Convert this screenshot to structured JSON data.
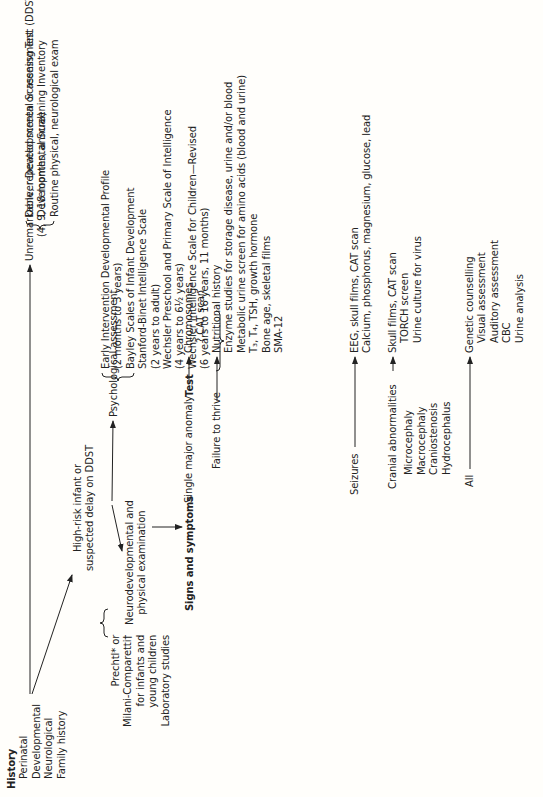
{
  "history": {
    "heading": "History",
    "items": [
      "Perinatal",
      "Developmental",
      "Neurological",
      "Family history"
    ]
  },
  "unremarkable": {
    "line1": "Unremarkable, repeated screen or assessment",
    "line2": "(4, 9, 18 months, annual)"
  },
  "screening_tests": [
    "Denver Developmental Screening Test (DDST)",
    "Developmental Screening Inventory",
    "Routine physical, neurological exam"
  ],
  "high_risk": {
    "line1": "High-risk infant or",
    "line2": "suspected delay on DDST"
  },
  "psych": {
    "label": "Psychological assessment",
    "items": [
      "Early Intervention Developmental Profile",
      "(2 months to 3 years)",
      "Bayley Scales of Infant Development",
      "Stanford-Binet Intelligence Scale",
      "(2 years to adult)",
      "Wechsler Preschool and Primary Scale of Intelligence",
      "(4 years to 6½ years)",
      "Wechsler Intelligence Scale for Children—Revised",
      "(6 years to 16 years, 11 months)"
    ]
  },
  "neuro_exam": {
    "line1": "Neurodevelopmental and",
    "line2": "physical examination"
  },
  "exam_methods": [
    "Prechtl* or",
    "Milani-Comparetti†",
    "for infants and",
    "young children",
    "Laboratory studies"
  ],
  "signs_heading": "Signs and symptoms",
  "test_heading": "Test",
  "rows": [
    {
      "sign": "Single major anomaly",
      "sub": [],
      "tests": [
        "Chromosomes",
        "? CAT scan"
      ],
      "indent": [
        false,
        true
      ]
    },
    {
      "sign": "Failure to thrive",
      "sub": [],
      "tests": [
        "Nutritional history",
        "Enzyme studies for storage disease, urine and/or blood",
        "Metabolic urine screen for amino acids (blood and urine)",
        "T₃, T₄, TSH, growth hormone",
        "Bone age, skeletal films",
        "SMA-12"
      ]
    },
    {
      "sign": "Seizures",
      "sub": [],
      "tests": [
        "EEG, skull films, CAT scan",
        "Calcium, phosphorus, magnesium, glucose, lead"
      ]
    },
    {
      "sign": "Cranial abnormalities",
      "sub": [
        "Microcephaly",
        "Macrocephaly",
        "Craniostenosis",
        "Hydrocephalus"
      ],
      "tests": [
        "Skull films, CAT scan",
        "TORCH screen",
        "Urine culture for virus"
      ]
    },
    {
      "sign": "All",
      "sub": [],
      "tests": [
        "Genetic counselling",
        "Visual assessment",
        "Auditory assessment",
        "CBC",
        "Urine analysis"
      ]
    }
  ]
}
